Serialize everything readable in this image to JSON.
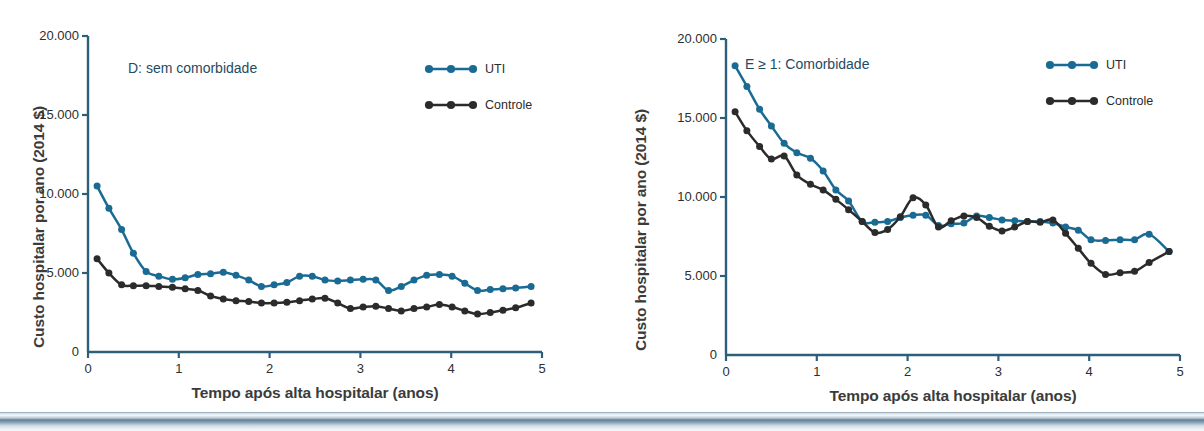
{
  "figure": {
    "axis_title_y": "Custo hospitalar por ano (2014 $)",
    "axis_title_x": "Tempo após alta hospitalar (anos)",
    "legend": {
      "uti_label": "UTI",
      "controle_label": "Controle"
    },
    "colors": {
      "uti": "#1a6b94",
      "controle": "#2b2b2b",
      "axis": "#2e5f7a",
      "title_text": "#1f4a63"
    }
  },
  "chart_data": [
    {
      "type": "line",
      "panel": "left",
      "title": "D: sem comorbidade",
      "xlabel": "Tempo após alta hospitalar (anos)",
      "ylabel": "Custo hospitalar por ano (2014 $)",
      "xlim": [
        0,
        5
      ],
      "ylim": [
        0,
        20000
      ],
      "xticks": [
        0,
        1,
        2,
        3,
        4,
        5
      ],
      "xtick_labels": [
        "0",
        "1",
        "2",
        "3",
        "4",
        "5"
      ],
      "yticks": [
        0,
        5000,
        10000,
        15000,
        20000
      ],
      "ytick_labels": [
        "0",
        "5.000",
        "10.000",
        "15.000",
        "20.000"
      ],
      "grid": false,
      "legend_position": "top-right",
      "series": [
        {
          "name": "UTI",
          "color": "#1a6b94",
          "x": [
            0.1,
            0.23,
            0.37,
            0.5,
            0.64,
            0.78,
            0.93,
            1.07,
            1.21,
            1.35,
            1.49,
            1.63,
            1.77,
            1.91,
            2.05,
            2.19,
            2.33,
            2.47,
            2.61,
            2.75,
            2.89,
            3.03,
            3.17,
            3.31,
            3.45,
            3.59,
            3.73,
            3.87,
            4.01,
            4.15,
            4.29,
            4.43,
            4.57,
            4.71,
            4.88
          ],
          "values": [
            10500,
            9100,
            7750,
            6250,
            5100,
            4800,
            4600,
            4700,
            4900,
            4950,
            5050,
            4850,
            4550,
            4150,
            4250,
            4400,
            4800,
            4800,
            4550,
            4500,
            4550,
            4600,
            4550,
            3900,
            4150,
            4550,
            4850,
            4900,
            4800,
            4350,
            3900,
            3950,
            4000,
            4050,
            4150
          ]
        },
        {
          "name": "Controle",
          "color": "#2b2b2b",
          "x": [
            0.1,
            0.23,
            0.37,
            0.5,
            0.64,
            0.78,
            0.93,
            1.07,
            1.21,
            1.35,
            1.49,
            1.63,
            1.77,
            1.91,
            2.05,
            2.19,
            2.33,
            2.47,
            2.61,
            2.75,
            2.89,
            3.03,
            3.17,
            3.31,
            3.45,
            3.59,
            3.73,
            3.87,
            4.01,
            4.15,
            4.29,
            4.43,
            4.57,
            4.71,
            4.88
          ],
          "values": [
            5900,
            5000,
            4250,
            4200,
            4200,
            4150,
            4100,
            4000,
            3900,
            3550,
            3350,
            3250,
            3200,
            3100,
            3100,
            3150,
            3250,
            3350,
            3400,
            3100,
            2750,
            2850,
            2900,
            2750,
            2600,
            2750,
            2850,
            3000,
            2850,
            2600,
            2400,
            2500,
            2650,
            2800,
            3100
          ]
        }
      ]
    },
    {
      "type": "line",
      "panel": "right",
      "title": "E ≥ 1: Comorbidade",
      "xlabel": "Tempo após alta hospitalar (anos)",
      "ylabel": "Custo hospitalar por ano (2014 $)",
      "xlim": [
        0,
        5
      ],
      "ylim": [
        0,
        20000
      ],
      "xticks": [
        0,
        1,
        2,
        3,
        4,
        5
      ],
      "xtick_labels": [
        "0",
        "1",
        "2",
        "3",
        "4",
        "5"
      ],
      "yticks": [
        0,
        5000,
        10000,
        15000,
        20000
      ],
      "ytick_labels": [
        "0",
        "5.000",
        "10.000",
        "15.000",
        "20.000"
      ],
      "grid": false,
      "legend_position": "top-right",
      "series": [
        {
          "name": "UTI",
          "color": "#1a6b94",
          "x": [
            0.1,
            0.23,
            0.37,
            0.5,
            0.64,
            0.78,
            0.93,
            1.07,
            1.21,
            1.35,
            1.5,
            1.64,
            1.78,
            1.92,
            2.06,
            2.2,
            2.34,
            2.48,
            2.62,
            2.76,
            2.9,
            3.04,
            3.18,
            3.32,
            3.46,
            3.6,
            3.74,
            3.88,
            4.02,
            4.18,
            4.34,
            4.5,
            4.66,
            4.88
          ],
          "values": [
            18300,
            17000,
            15550,
            14500,
            13400,
            12800,
            12450,
            11650,
            10450,
            9750,
            8450,
            8400,
            8450,
            8700,
            8850,
            8850,
            8200,
            8300,
            8350,
            8800,
            8700,
            8550,
            8500,
            8450,
            8450,
            8350,
            8100,
            7900,
            7300,
            7250,
            7300,
            7300,
            7650,
            6550
          ]
        },
        {
          "name": "Controle",
          "color": "#2b2b2b",
          "x": [
            0.1,
            0.23,
            0.37,
            0.5,
            0.64,
            0.78,
            0.93,
            1.07,
            1.21,
            1.35,
            1.5,
            1.64,
            1.78,
            1.92,
            2.06,
            2.2,
            2.34,
            2.48,
            2.62,
            2.76,
            2.9,
            3.04,
            3.18,
            3.32,
            3.46,
            3.6,
            3.74,
            3.88,
            4.02,
            4.18,
            4.34,
            4.5,
            4.66,
            4.88
          ],
          "values": [
            15400,
            14200,
            13200,
            12400,
            12600,
            11400,
            10800,
            10450,
            9850,
            9200,
            8450,
            7750,
            7950,
            8750,
            9950,
            9500,
            8100,
            8500,
            8800,
            8700,
            8150,
            7850,
            8100,
            8450,
            8400,
            8550,
            7700,
            6750,
            5800,
            5100,
            5200,
            5300,
            5850,
            6550
          ]
        }
      ]
    }
  ]
}
